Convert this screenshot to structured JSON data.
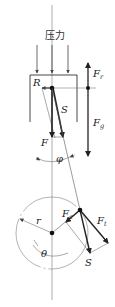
{
  "diagram": {
    "title": "",
    "colors": {
      "line": "#222222",
      "thin": "#555555",
      "background": "#ffffff"
    },
    "labels": {
      "pressure": "压力",
      "R": "R",
      "S_top": "S",
      "F": "F",
      "Fr_main": "F",
      "Fr_sub": "r",
      "Fg_main": "F",
      "Fg_sub": "g",
      "phi": "φ",
      "Fc_main": "F",
      "Fc_sub": "c",
      "Ft_main": "F",
      "Ft_sub": "t",
      "r": "r",
      "theta": "θ",
      "S_bottom": "S"
    },
    "elements": [
      "pressure-arrows (3 downward)",
      "piston outline",
      "piston pin with force parallelogram (R, S, F)",
      "vertical force line (Fr up, Fg down)",
      "connecting rod with angle phi",
      "crank circle radius r, angle theta",
      "crank pin force parallelogram (Fc, Ft, S)"
    ]
  }
}
